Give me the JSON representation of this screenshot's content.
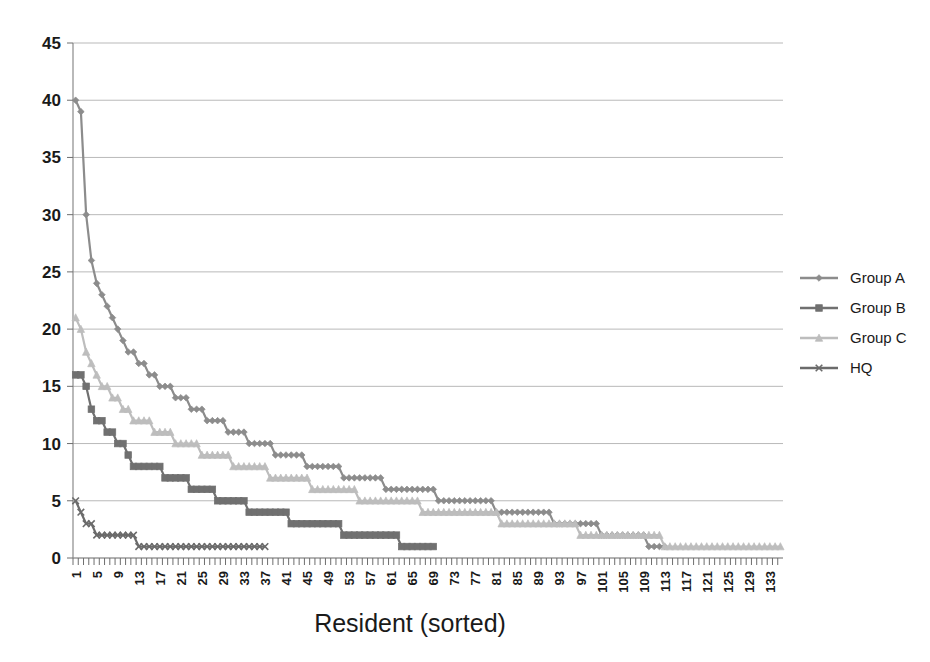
{
  "chart_data": {
    "type": "line",
    "title": "",
    "xlabel": "Resident (sorted)",
    "ylabel": "",
    "xlim": [
      1,
      135
    ],
    "ylim": [
      0,
      45
    ],
    "ytick_step": 5,
    "yticks": [
      0,
      5,
      10,
      15,
      20,
      25,
      30,
      35,
      40,
      45
    ],
    "xticks": [
      1,
      5,
      9,
      13,
      17,
      21,
      25,
      29,
      33,
      37,
      41,
      45,
      49,
      53,
      57,
      61,
      65,
      69,
      73,
      77,
      81,
      85,
      89,
      93,
      97,
      101,
      105,
      109,
      113,
      117,
      121,
      125,
      129,
      133
    ],
    "xtick_label_rotation": -90,
    "grid": "horizontal",
    "legend_position": "right",
    "series": [
      {
        "name": "Group A",
        "marker": "diamond",
        "color": "#8c8c8c",
        "values": [
          40,
          39,
          30,
          26,
          24,
          23,
          22,
          21,
          20,
          19,
          18,
          18,
          17,
          17,
          16,
          16,
          15,
          15,
          15,
          14,
          14,
          14,
          13,
          13,
          13,
          12,
          12,
          12,
          12,
          11,
          11,
          11,
          11,
          10,
          10,
          10,
          10,
          10,
          9,
          9,
          9,
          9,
          9,
          9,
          8,
          8,
          8,
          8,
          8,
          8,
          8,
          7,
          7,
          7,
          7,
          7,
          7,
          7,
          7,
          6,
          6,
          6,
          6,
          6,
          6,
          6,
          6,
          6,
          6,
          5,
          5,
          5,
          5,
          5,
          5,
          5,
          5,
          5,
          5,
          5,
          4,
          4,
          4,
          4,
          4,
          4,
          4,
          4,
          4,
          4,
          4,
          3,
          3,
          3,
          3,
          3,
          3,
          3,
          3,
          3,
          2,
          2,
          2,
          2,
          2,
          2,
          2,
          2,
          2,
          1,
          1,
          1,
          1
        ]
      },
      {
        "name": "Group B",
        "marker": "square",
        "color": "#707070",
        "values": [
          16,
          16,
          15,
          13,
          12,
          12,
          11,
          11,
          10,
          10,
          9,
          8,
          8,
          8,
          8,
          8,
          8,
          7,
          7,
          7,
          7,
          7,
          6,
          6,
          6,
          6,
          6,
          5,
          5,
          5,
          5,
          5,
          5,
          4,
          4,
          4,
          4,
          4,
          4,
          4,
          4,
          3,
          3,
          3,
          3,
          3,
          3,
          3,
          3,
          3,
          3,
          2,
          2,
          2,
          2,
          2,
          2,
          2,
          2,
          2,
          2,
          2,
          1,
          1,
          1,
          1,
          1,
          1,
          1
        ]
      },
      {
        "name": "Group C",
        "marker": "triangle",
        "color": "#bdbdbd",
        "values": [
          21,
          20,
          18,
          17,
          16,
          15,
          15,
          14,
          14,
          13,
          13,
          12,
          12,
          12,
          12,
          11,
          11,
          11,
          11,
          10,
          10,
          10,
          10,
          10,
          9,
          9,
          9,
          9,
          9,
          9,
          8,
          8,
          8,
          8,
          8,
          8,
          8,
          7,
          7,
          7,
          7,
          7,
          7,
          7,
          7,
          6,
          6,
          6,
          6,
          6,
          6,
          6,
          6,
          6,
          5,
          5,
          5,
          5,
          5,
          5,
          5,
          5,
          5,
          5,
          5,
          5,
          4,
          4,
          4,
          4,
          4,
          4,
          4,
          4,
          4,
          4,
          4,
          4,
          4,
          4,
          4,
          3,
          3,
          3,
          3,
          3,
          3,
          3,
          3,
          3,
          3,
          3,
          3,
          3,
          3,
          3,
          2,
          2,
          2,
          2,
          2,
          2,
          2,
          2,
          2,
          2,
          2,
          2,
          2,
          2,
          2,
          2,
          1,
          1,
          1,
          1,
          1,
          1,
          1,
          1,
          1,
          1,
          1,
          1,
          1,
          1,
          1,
          1,
          1,
          1,
          1,
          1,
          1,
          1,
          1
        ]
      },
      {
        "name": "HQ",
        "marker": "x",
        "color": "#6b6b6b",
        "values": [
          5,
          4,
          3,
          3,
          2,
          2,
          2,
          2,
          2,
          2,
          2,
          2,
          1,
          1,
          1,
          1,
          1,
          1,
          1,
          1,
          1,
          1,
          1,
          1,
          1,
          1,
          1,
          1,
          1,
          1,
          1,
          1,
          1,
          1,
          1,
          1,
          1
        ]
      }
    ]
  },
  "legend": {
    "items": [
      {
        "label": "Group A"
      },
      {
        "label": "Group B"
      },
      {
        "label": "Group C"
      },
      {
        "label": "HQ"
      }
    ]
  },
  "axis": {
    "x_title": "Resident (sorted)"
  }
}
